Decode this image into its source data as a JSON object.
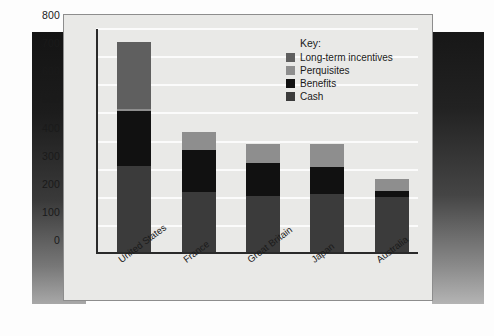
{
  "chart_data": {
    "type": "bar",
    "stacked": true,
    "title": "",
    "xlabel": "",
    "ylabel": "",
    "ylim": [
      0,
      800
    ],
    "yticks": [
      0,
      100,
      200,
      300,
      400,
      500,
      600,
      700,
      800
    ],
    "grid": true,
    "legend_position": "top-right",
    "legend_title": "Key:",
    "categories": [
      "United States",
      "France",
      "Great Britain",
      "Japan",
      "Australia"
    ],
    "series": [
      {
        "name": "Cash",
        "color": "#3b3b3b",
        "values": [
          305,
          215,
          200,
          205,
          195
        ]
      },
      {
        "name": "Benefits",
        "color": "#111111",
        "values": [
          195,
          147,
          115,
          97,
          23
        ]
      },
      {
        "name": "Perquisites",
        "color": "#8e8e8e",
        "values": [
          10,
          63,
          70,
          83,
          40
        ]
      },
      {
        "name": "Long-term incentives",
        "color": "#5f5f5f",
        "values": [
          235,
          0,
          0,
          0,
          0
        ]
      }
    ],
    "totals": [
      745,
      425,
      385,
      385,
      258
    ]
  },
  "legend": {
    "title": "Key:",
    "items": [
      {
        "label": "Long-term incentives",
        "color": "#5f5f5f"
      },
      {
        "label": "Perquisites",
        "color": "#8e8e8e"
      },
      {
        "label": "Benefits",
        "color": "#111111"
      },
      {
        "label": "Cash",
        "color": "#3b3b3b"
      }
    ]
  }
}
